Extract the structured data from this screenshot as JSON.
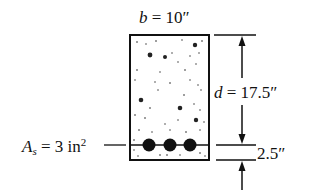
{
  "diagram": {
    "width_label": {
      "symbol": "b",
      "eq": " = ",
      "value": "10″"
    },
    "depth_label": {
      "symbol": "d",
      "eq": " = ",
      "value": "17.5″"
    },
    "cover_label": {
      "value": "2.5″"
    },
    "steel_label": {
      "symbol": "A",
      "subscript": "s",
      "eq": " = 3 in",
      "superscript": "2"
    },
    "rebar_count": 3,
    "colors": {
      "line": "#111111",
      "background": "#ffffff"
    }
  }
}
